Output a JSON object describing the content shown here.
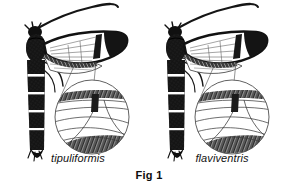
{
  "figure": {
    "caption": "Fig 1",
    "background_color": "#ffffff",
    "ink_color": "#111111",
    "specimens": [
      {
        "name": "tipuliformis",
        "side": "left",
        "description": "clearwing moth with dark banded abdomen, transparent forewing and magnified wing-margin inset"
      },
      {
        "name": "flaviventris",
        "side": "right",
        "description": "clearwing moth with dark banded abdomen, transparent forewing and magnified wing-margin inset"
      }
    ]
  }
}
